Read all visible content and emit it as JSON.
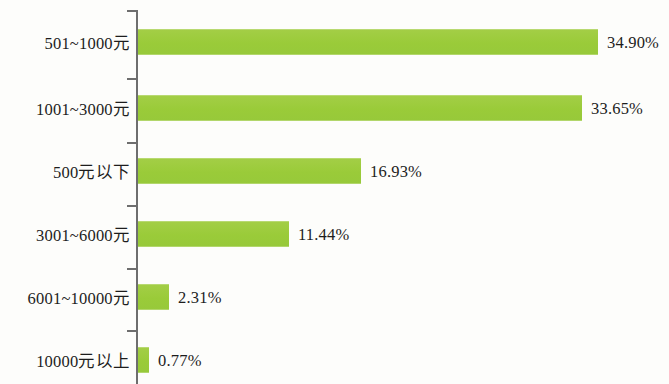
{
  "chart_data": {
    "type": "bar",
    "orientation": "horizontal",
    "title": "",
    "subtitle": "",
    "xlabel": "",
    "ylabel": "",
    "categories": [
      "501~1000元",
      "1001~3000元",
      "500元以下",
      "3001~6000元",
      "6001~10000元",
      "10000元以上"
    ],
    "values": [
      34.9,
      33.65,
      16.93,
      11.44,
      2.31,
      0.77
    ],
    "value_labels": [
      "34.90%",
      "33.65%",
      "16.93%",
      "11.44%",
      "2.31%",
      "0.77%"
    ],
    "xlim": [
      0,
      36
    ],
    "grid": false,
    "legend": null,
    "bar_color": "#9ecc3f",
    "axis_color": "#6e6e6e",
    "text_color": "#1d1d1d",
    "background_color": "#fdfdfb"
  },
  "rows": [
    {
      "label": "501~1000元",
      "value_label": "34.90%",
      "bar_px": 460
    },
    {
      "label": "1001~3000元",
      "value_label": "33.65%",
      "bar_px": 444
    },
    {
      "label": "500元以下",
      "value_label": "16.93%",
      "bar_px": 223
    },
    {
      "label": "3001~6000元",
      "value_label": "11.44%",
      "bar_px": 151
    },
    {
      "label": "6001~10000元",
      "value_label": "2.31%",
      "bar_px": 31
    },
    {
      "label": "10000元以上",
      "value_label": "0.77%",
      "bar_px": 11
    }
  ]
}
